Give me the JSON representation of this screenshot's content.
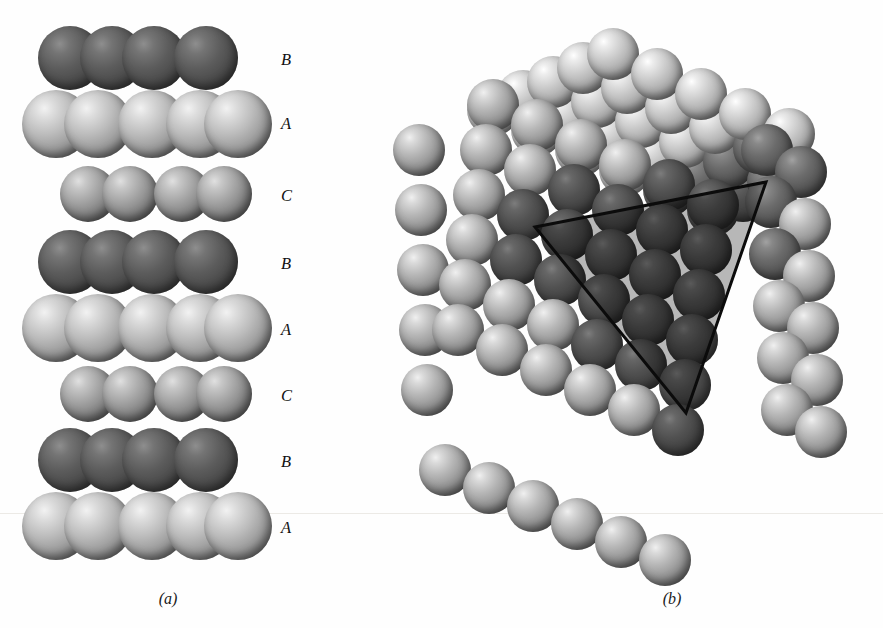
{
  "figure": {
    "background_color": "#fefefe",
    "baseline_rule_y": 513,
    "panels": [
      {
        "id": "a",
        "caption": "(a)",
        "caption_x": 108,
        "caption_y": 590
      },
      {
        "id": "b",
        "caption": "(b)",
        "caption_x": 612,
        "caption_y": 590
      }
    ]
  },
  "panel_a": {
    "name": "stacking-sequence-column",
    "description": "Vertical stack of close-packed sphere layers showing ABCABC stacking",
    "sphere_shade_colors": {
      "A": "#c8c8c8",
      "B": "#4a4a4a",
      "C": "#9a9a9a"
    },
    "layer_labels": [
      {
        "label": "B",
        "y": 50,
        "shade": "B"
      },
      {
        "label": "A",
        "y": 114,
        "shade": "A"
      },
      {
        "label": "C",
        "y": 186,
        "shade": "C"
      },
      {
        "label": "B",
        "y": 254,
        "shade": "B"
      },
      {
        "label": "A",
        "y": 320,
        "shade": "A"
      },
      {
        "label": "C",
        "y": 386,
        "shade": "C"
      },
      {
        "label": "B",
        "y": 452,
        "shade": "B"
      },
      {
        "label": "A",
        "y": 518,
        "shade": "A"
      }
    ],
    "layers": [
      {
        "label": "B",
        "shade": "B",
        "row": "front",
        "cy": 58,
        "r": 32,
        "xs": [
          70,
          112,
          154,
          206
        ]
      },
      {
        "label": "A",
        "shade": "A",
        "row": "front",
        "cy": 124,
        "r": 34,
        "xs": [
          56,
          98,
          152,
          200,
          238
        ]
      },
      {
        "label": "C",
        "shade": "C",
        "row": "back",
        "cy": 194,
        "r": 28,
        "xs": [
          88,
          130,
          182,
          224
        ]
      },
      {
        "label": "B",
        "shade": "B",
        "row": "front",
        "cy": 262,
        "r": 32,
        "xs": [
          70,
          112,
          154,
          206
        ]
      },
      {
        "label": "A",
        "shade": "A",
        "row": "front",
        "cy": 328,
        "r": 34,
        "xs": [
          56,
          98,
          152,
          200,
          238
        ]
      },
      {
        "label": "C",
        "shade": "C",
        "row": "back",
        "cy": 394,
        "r": 28,
        "xs": [
          88,
          130,
          182,
          224
        ]
      },
      {
        "label": "B",
        "shade": "B",
        "row": "front",
        "cy": 460,
        "r": 32,
        "xs": [
          70,
          112,
          154,
          206
        ]
      },
      {
        "label": "A",
        "shade": "A",
        "row": "front",
        "cy": 526,
        "r": 34,
        "xs": [
          56,
          98,
          152,
          200,
          238
        ]
      }
    ]
  },
  "panel_b": {
    "name": "fcc-crystal-block",
    "description": "Face-centred-cubic sphere packing block with a black triangle outlining a (111) close-packed plane",
    "triangle": {
      "stroke_color": "#0b0b0b",
      "stroke_width": 3,
      "fill": "rgba(0,0,0,0.28)",
      "vertices": [
        {
          "x": 140,
          "y": 227
        },
        {
          "x": 371,
          "y": 182
        },
        {
          "x": 291,
          "y": 413
        }
      ]
    },
    "sphere_count": 104,
    "sphere_radius": 26
  }
}
